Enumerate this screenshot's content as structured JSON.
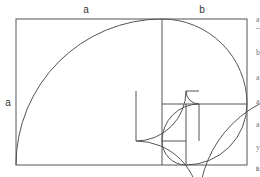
{
  "diagram": {
    "labels": {
      "top_a": "a",
      "top_b": "b",
      "left_a": "a"
    },
    "colors": {
      "stroke": "#555555",
      "background": "#ffffff"
    },
    "subdivision_count": 9
  },
  "side_text": {
    "fragments": [
      "a",
      "—",
      "b",
      "a",
      "a",
      "a",
      "y",
      "t",
      "a"
    ]
  }
}
